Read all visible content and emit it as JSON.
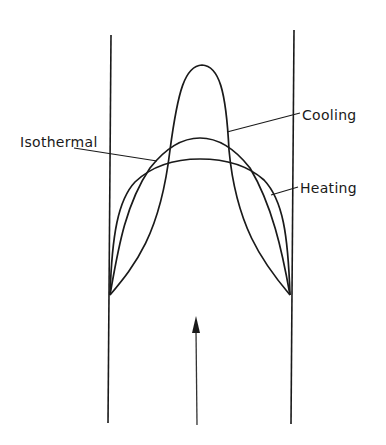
{
  "figure": {
    "labels": {
      "cooling": "Cooling",
      "isothermal": "Isothermal",
      "heating": "Heating"
    },
    "flow_direction": "up",
    "colors": {
      "line": "#1a1a1a",
      "background": "#ffffff"
    }
  }
}
